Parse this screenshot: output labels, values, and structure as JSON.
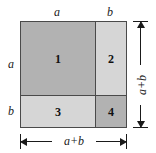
{
  "figure": {
    "colors": {
      "region_dark": "#b2b2b2",
      "region_light": "#d6d6d6",
      "stroke": "#4a4a4a",
      "dimension_stroke": "#1a1a1a",
      "background": "#ffffff",
      "text": "#111111"
    },
    "outer_square": {
      "side_label": "a+b"
    },
    "regions": [
      {
        "id": "1",
        "label": "1",
        "width_label": "a",
        "height_label": "a",
        "fill": "#b2b2b2"
      },
      {
        "id": "2",
        "label": "2",
        "width_label": "b",
        "height_label": "a",
        "fill": "#d6d6d6"
      },
      {
        "id": "3",
        "label": "3",
        "width_label": "a",
        "height_label": "b",
        "fill": "#d6d6d6"
      },
      {
        "id": "4",
        "label": "4",
        "width_label": "b",
        "height_label": "b",
        "fill": "#b2b2b2"
      }
    ],
    "edge_labels": {
      "top_left": "a",
      "top_right": "b",
      "left_upper": "a",
      "left_lower": "b"
    },
    "dimensions": {
      "vertical": "a+b",
      "horizontal": "a+b"
    }
  }
}
